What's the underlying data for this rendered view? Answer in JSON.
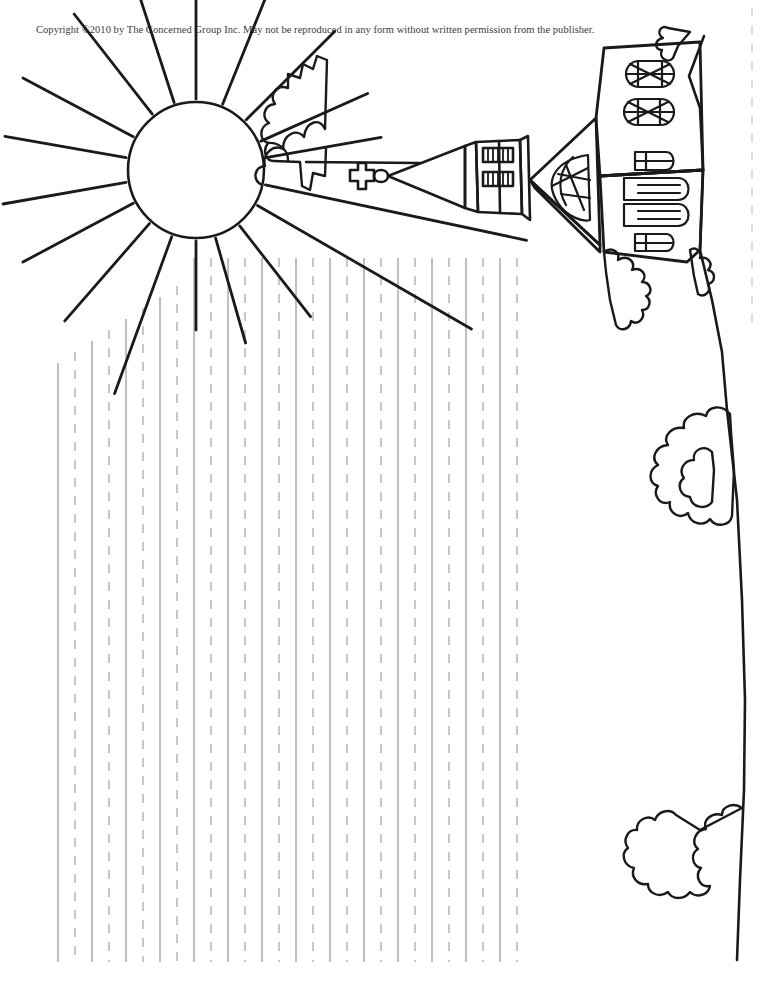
{
  "page": {
    "width": 765,
    "height": 1001,
    "background_color": "#ffffff",
    "kind": "handwriting-practice-worksheet",
    "orientation_note": "illustration rotated sideways; writing rules are vertical"
  },
  "copyright": {
    "text": "Copyright ©2010 by The Concerned Group Inc. May not be reproduced in any form without written permission from the publisher.",
    "color": "#3a3a3a",
    "font_size_px": 10.5
  },
  "illustration": {
    "title": "Church on a hill with sun and cloud",
    "ink_color": "#1a1a1a",
    "elements": [
      {
        "name": "sun",
        "shape": "circle",
        "center_x": 196,
        "center_y": 170,
        "radius": 68,
        "ray_count": 16
      },
      {
        "name": "cloud",
        "shape": "puffy-outline",
        "center_x": 297,
        "center_y": 112
      },
      {
        "name": "church-steeple",
        "shape": "tapered-tower",
        "center_x": 470,
        "center_y": 175
      },
      {
        "name": "steeple-cross",
        "shape": "latin-cross",
        "center_x": 362,
        "center_y": 176
      },
      {
        "name": "belfry-louvers",
        "count": 2
      },
      {
        "name": "church-nave",
        "shape": "gabled-building",
        "center_x": 640,
        "center_y": 150
      },
      {
        "name": "rose-windows",
        "count": 3
      },
      {
        "name": "arched-windows",
        "count": 4
      },
      {
        "name": "hillside-outline",
        "shape": "curving-edge"
      },
      {
        "name": "shrub-cluster-upper",
        "center_x": 675,
        "center_y": 260
      },
      {
        "name": "shrub-cluster-middle",
        "center_x": 678,
        "center_y": 465
      },
      {
        "name": "shrub-cluster-lower",
        "center_x": 690,
        "center_y": 870
      },
      {
        "name": "page-edge-dashes",
        "x": 752
      }
    ]
  },
  "writing_rules": {
    "description": "Alternating solid baseline rules and dashed midline guides running vertically",
    "solid_color": "#808080",
    "dashed_color": "#909090",
    "line_width_px": 1,
    "dash_pattern": "9 9",
    "spacing_px": 17,
    "first_x": 58,
    "count": 28,
    "top_y": 258,
    "bottom_y": 962,
    "stepped_top_note": "leftmost rules are shortened where a sun ray crosses; the tops follow the ray diagonals",
    "tops": [
      363,
      352,
      341,
      330,
      319,
      308,
      297,
      286,
      258,
      258,
      258,
      258,
      258,
      258,
      258,
      258,
      258,
      258,
      258,
      258,
      258,
      258,
      258,
      258,
      258,
      258,
      258,
      258
    ]
  }
}
